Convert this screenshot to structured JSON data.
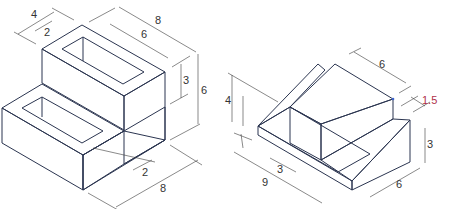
{
  "colors": {
    "top_face": "#e2e7f5",
    "left_face": "#c7cff0",
    "right_face": "#a4b0e6",
    "edge": "#2b3550",
    "dimension_line": "#3a3a3a",
    "highlight_label": "#b0304a",
    "corner_marker": "#3d63c8"
  },
  "figures": [
    {
      "name": "stepped-block-with-slots",
      "dimensions": {
        "slot_width_outer": "4",
        "slot_width_inner": "2",
        "top_length_overall": "8",
        "top_slot_length": "6",
        "upper_step_height": "3",
        "total_height": "6",
        "lower_slot_offset": "2",
        "base_length": "8"
      }
    },
    {
      "name": "inclined-step-block",
      "dimensions": {
        "top_length": "6",
        "offset": "1.5",
        "left_height": "4",
        "base_length": "9",
        "step_depth": "3",
        "right_height": "3",
        "base_width": "6"
      }
    }
  ]
}
